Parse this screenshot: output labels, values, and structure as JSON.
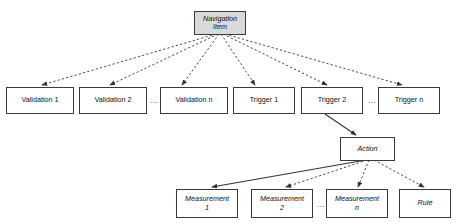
{
  "diagram": {
    "background_color": "#ffffff",
    "node_border_color": "#3a3a3a",
    "node_fill_color": "#ffffff",
    "root_fill_color": "#d9d9d9",
    "edge_color": "#333333",
    "nodes": [
      {
        "id": "navigation-item",
        "label": "Navigation\nItem",
        "line1": "Navigation",
        "line2": "Item",
        "style": "italic-shaded"
      },
      {
        "id": "validation-1",
        "label": "Validation 1",
        "style": "plain"
      },
      {
        "id": "validation-2",
        "label": "Validation 2",
        "style": "plain"
      },
      {
        "id": "validation-n",
        "label": "Validation n",
        "style": "plain"
      },
      {
        "id": "trigger-1",
        "label": "Trigger 1",
        "style": "plain"
      },
      {
        "id": "trigger-2",
        "label": "Trigger 2",
        "style": "plain"
      },
      {
        "id": "trigger-n",
        "label": "Trigger n",
        "style": "plain"
      },
      {
        "id": "action",
        "label": "Action",
        "style": "italic"
      },
      {
        "id": "measurement-1",
        "line1": "Measurement",
        "line2": "1",
        "label": "Measurement 1",
        "style": "italic"
      },
      {
        "id": "measurement-2",
        "line1": "Measurement",
        "line2": "2",
        "label": "Measurement 2",
        "style": "italic"
      },
      {
        "id": "measurement-n",
        "line1": "Measurement",
        "line2": "n",
        "label": "Measurement n",
        "style": "italic"
      },
      {
        "id": "rule",
        "label": "Rule",
        "style": "italic"
      }
    ],
    "ellipses": [
      {
        "id": "ellipsis-validation",
        "label": "..."
      },
      {
        "id": "ellipsis-trigger",
        "label": "..."
      },
      {
        "id": "ellipsis-measurement",
        "label": "..."
      }
    ],
    "edges": [
      {
        "from": "navigation-item",
        "to": "validation-1",
        "style": "dashed",
        "arrow": "filled"
      },
      {
        "from": "navigation-item",
        "to": "validation-2",
        "style": "dashed",
        "arrow": "filled"
      },
      {
        "from": "navigation-item",
        "to": "validation-n",
        "style": "dashed",
        "arrow": "filled"
      },
      {
        "from": "navigation-item",
        "to": "trigger-1",
        "style": "dashed",
        "arrow": "filled"
      },
      {
        "from": "navigation-item",
        "to": "trigger-2",
        "style": "dashed",
        "arrow": "filled"
      },
      {
        "from": "navigation-item",
        "to": "trigger-n",
        "style": "dashed",
        "arrow": "filled"
      },
      {
        "from": "trigger-2",
        "to": "action",
        "style": "solid",
        "arrow": "filled"
      },
      {
        "from": "action",
        "to": "measurement-1",
        "style": "solid",
        "arrow": "filled"
      },
      {
        "from": "action",
        "to": "measurement-2",
        "style": "dashed",
        "arrow": "filled"
      },
      {
        "from": "action",
        "to": "measurement-n",
        "style": "dashed",
        "arrow": "filled"
      },
      {
        "from": "action",
        "to": "rule",
        "style": "dashed",
        "arrow": "filled"
      }
    ]
  }
}
